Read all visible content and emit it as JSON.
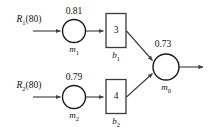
{
  "diagram": {
    "type": "reliability-block-diagram",
    "background_color": "#ffffff",
    "line_color": "#3f3f3f",
    "text_color": "#111111",
    "sources": [
      {
        "id": "R1",
        "label_main": "R",
        "label_sub": "1",
        "label_paren": "(80)",
        "full": "R1(80)"
      },
      {
        "id": "R2",
        "label_main": "R",
        "label_sub": "2",
        "label_paren": "(80)",
        "full": "R2(80)"
      }
    ],
    "nodes": [
      {
        "id": "m1",
        "name_main": "m",
        "name_sub": "1",
        "weight": "0.81"
      },
      {
        "id": "m2",
        "name_main": "m",
        "name_sub": "2",
        "weight": "0.79"
      },
      {
        "id": "m0",
        "name_main": "m",
        "name_sub": "0",
        "weight": "0.73"
      }
    ],
    "boxes": [
      {
        "id": "b1",
        "value": "3",
        "name_main": "b",
        "name_sub": "1"
      },
      {
        "id": "b2",
        "value": "4",
        "name_main": "b",
        "name_sub": "2"
      }
    ],
    "edges": [
      {
        "from": "R1",
        "to": "m1",
        "style": "arrow"
      },
      {
        "from": "m1",
        "to": "b1",
        "style": "arrow"
      },
      {
        "from": "b1",
        "to": "m0",
        "style": "arrow"
      },
      {
        "from": "R2",
        "to": "m2",
        "style": "arrow"
      },
      {
        "from": "m2",
        "to": "b2",
        "style": "arrow"
      },
      {
        "from": "b2",
        "to": "m0",
        "style": "arrow"
      },
      {
        "from": "m0",
        "to": "output",
        "style": "arrow"
      }
    ]
  }
}
